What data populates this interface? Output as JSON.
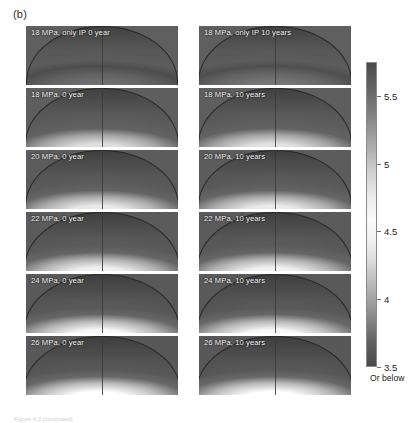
{
  "figure": {
    "part_label": "(b)",
    "caption_fragment": "Figure 4.3 (continued)",
    "background_color": "#ffffff"
  },
  "chart_data": {
    "type": "heatmap",
    "title": "(b)",
    "xlabel": "",
    "ylabel": "",
    "grid": false,
    "legend_position": "right",
    "rows": 6,
    "columns": 2,
    "column_headers": [
      "0 year",
      "10 years"
    ],
    "row_pressures": [
      "18 MPa, only IP",
      "18 MPa",
      "20 MPa",
      "22 MPa",
      "24 MPa",
      "26 MPa"
    ],
    "panels": [
      {
        "label": "18 MPa, only IP 0 year",
        "pressure_mpa": 18,
        "time_years": 0,
        "case": "only IP",
        "row": 1,
        "column": 1,
        "plume_peak_value": 4.9,
        "background_value": 4.2,
        "core_brightness": 0.22,
        "dome_span": 0.96,
        "dome_height": 0.93
      },
      {
        "label": "18 MPa, only IP 10 years",
        "pressure_mpa": 18,
        "time_years": 10,
        "case": "only IP",
        "row": 1,
        "column": 2,
        "plume_peak_value": 4.95,
        "background_value": 4.2,
        "core_brightness": 0.26,
        "dome_span": 0.97,
        "dome_height": 0.93
      },
      {
        "label": "18 MPa, 0 year",
        "pressure_mpa": 18,
        "time_years": 0,
        "case": "full",
        "row": 2,
        "column": 1,
        "plume_peak_value": 5.6,
        "background_value": 4.1,
        "core_brightness": 0.82,
        "dome_span": 0.97,
        "dome_height": 0.95
      },
      {
        "label": "18 MPa, 10 years",
        "pressure_mpa": 18,
        "time_years": 10,
        "case": "full",
        "row": 2,
        "column": 2,
        "plume_peak_value": 5.6,
        "background_value": 4.1,
        "core_brightness": 0.84,
        "dome_span": 0.97,
        "dome_height": 0.95
      },
      {
        "label": "20 MPa, 0 year",
        "pressure_mpa": 20,
        "time_years": 0,
        "case": "full",
        "row": 3,
        "column": 1,
        "plume_peak_value": 5.7,
        "background_value": 4.0,
        "core_brightness": 0.88,
        "dome_span": 0.98,
        "dome_height": 0.96
      },
      {
        "label": "20 MPa, 10 years",
        "pressure_mpa": 20,
        "time_years": 10,
        "case": "full",
        "row": 3,
        "column": 2,
        "plume_peak_value": 5.7,
        "background_value": 4.0,
        "core_brightness": 0.89,
        "dome_span": 0.98,
        "dome_height": 0.96
      },
      {
        "label": "22 MPa, 0 year",
        "pressure_mpa": 22,
        "time_years": 0,
        "case": "full",
        "row": 4,
        "column": 1,
        "plume_peak_value": 5.8,
        "background_value": 3.9,
        "core_brightness": 0.92,
        "dome_span": 0.985,
        "dome_height": 0.97
      },
      {
        "label": "22 MPa, 10 years",
        "pressure_mpa": 22,
        "time_years": 10,
        "case": "full",
        "row": 4,
        "column": 2,
        "plume_peak_value": 5.8,
        "background_value": 3.9,
        "core_brightness": 0.93,
        "dome_span": 0.985,
        "dome_height": 0.97
      },
      {
        "label": "24 MPa, 0 year",
        "pressure_mpa": 24,
        "time_years": 0,
        "case": "full",
        "row": 5,
        "column": 1,
        "plume_peak_value": 5.9,
        "background_value": 3.8,
        "core_brightness": 0.96,
        "dome_span": 0.99,
        "dome_height": 0.98
      },
      {
        "label": "24 MPa, 10 years",
        "pressure_mpa": 24,
        "time_years": 10,
        "case": "full",
        "row": 5,
        "column": 2,
        "plume_peak_value": 5.9,
        "background_value": 3.8,
        "core_brightness": 0.96,
        "dome_span": 0.99,
        "dome_height": 0.98
      },
      {
        "label": "26 MPa, 0 year",
        "pressure_mpa": 26,
        "time_years": 0,
        "case": "full",
        "row": 6,
        "column": 1,
        "plume_peak_value": 6.0,
        "background_value": 3.7,
        "core_brightness": 1.0,
        "dome_span": 0.995,
        "dome_height": 0.99
      },
      {
        "label": "26 MPa, 10 years",
        "pressure_mpa": 26,
        "time_years": 10,
        "case": "full",
        "row": 6,
        "column": 2,
        "plume_peak_value": 6.0,
        "background_value": 3.7,
        "core_brightness": 1.0,
        "dome_span": 0.995,
        "dome_height": 0.99
      }
    ],
    "colorbar": {
      "orientation": "vertical",
      "tick_labels": [
        "5.5",
        "5",
        "4.5",
        "4",
        "3.5"
      ],
      "tick_values": [
        5.5,
        5,
        4.5,
        4,
        3.5
      ],
      "vmin": 3.5,
      "vmax": 5.75,
      "below_min_note": "Or below",
      "colormap": "grayscale-diverging-light-center"
    }
  }
}
